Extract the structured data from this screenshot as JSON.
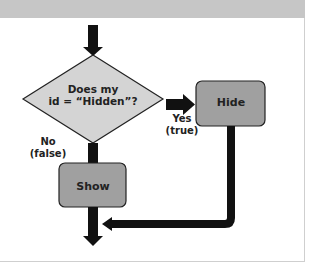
{
  "diagram": {
    "type": "flowchart",
    "decision": {
      "line1": "Does my",
      "line2": "id = “Hidden”?"
    },
    "branches": {
      "yes": {
        "line1": "Yes",
        "line2": "(true)"
      },
      "no": {
        "line1": "No",
        "line2": "(false)"
      }
    },
    "actions": {
      "hide": "Hide",
      "show": "Show"
    },
    "colors": {
      "header": "#c6c6c6",
      "decision_fill": "#d4d4d4",
      "action_fill": "#a0a0a0",
      "arrow": "#111111",
      "outline": "#222222"
    }
  }
}
